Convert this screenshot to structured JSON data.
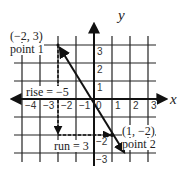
{
  "diagram": {
    "type": "coordinate-plane-slope",
    "axes": {
      "x_label": "x",
      "y_label": "y"
    },
    "x_ticks": [
      "−4",
      "−3",
      "−2",
      "−1",
      "0",
      "1",
      "2",
      "3"
    ],
    "y_ticks": [
      "3",
      "2",
      "1",
      "−2",
      "−3"
    ],
    "points": [
      {
        "coord": "(−2, 3)",
        "name": "point 1"
      },
      {
        "coord": "(1, −2)",
        "name": "point 2"
      }
    ],
    "rise_label": "rise = −5",
    "run_label": "run = 3",
    "colors": {
      "line": "#111111",
      "grid": "#222222"
    }
  }
}
